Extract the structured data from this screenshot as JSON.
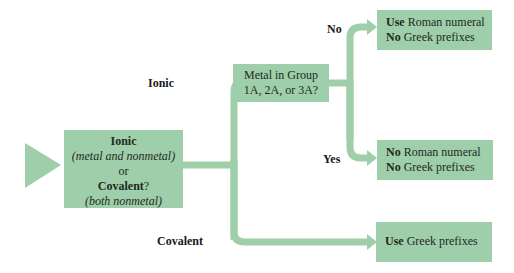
{
  "colors": {
    "box_fill": "#9fceaa",
    "connector": "#9fceaa",
    "text": "#1e2a1e"
  },
  "start": {
    "line1_bold": "Ionic",
    "line2_italic": "(metal and nonmetal)",
    "line3": "or",
    "line4_bold": "Covalent",
    "line4_suffix": "?",
    "line5_italic": "(both nonmetal)"
  },
  "branch_labels": {
    "ionic": "Ionic",
    "covalent": "Covalent",
    "no": "No",
    "yes": "Yes"
  },
  "question": {
    "line1": "Metal in Group",
    "line2": "1A, 2A, or 3A?"
  },
  "outcome_no": {
    "l1_bold": "Use",
    "l1_rest": " Roman numeral",
    "l2_bold": "No",
    "l2_rest": " Greek prefixes"
  },
  "outcome_yes": {
    "l1_bold": "No",
    "l1_rest": " Roman numeral",
    "l2_bold": "No",
    "l2_rest": " Greek prefixes"
  },
  "outcome_covalent": {
    "l1_bold": "Use",
    "l1_rest": " Greek prefixes"
  }
}
